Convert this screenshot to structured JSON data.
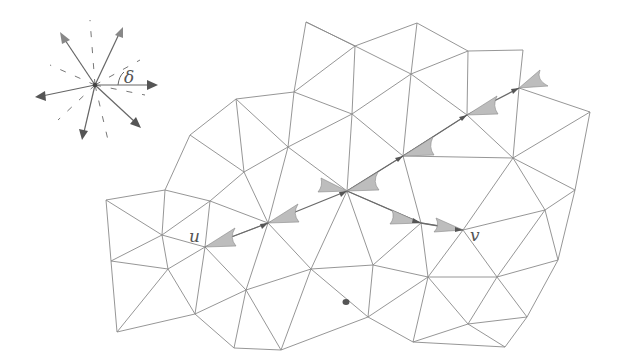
{
  "diagram": {
    "type": "triangle-mesh-path",
    "labels": {
      "u": "u",
      "v": "v",
      "delta": "δ"
    },
    "colors": {
      "mesh_edge": "#8a8a8a",
      "path_edge": "#6a6a6a",
      "cone_fill": "#bdbdbd",
      "arrowhead": "#555555"
    },
    "vertices": [
      [
        306,
        22
      ],
      [
        417,
        23
      ],
      [
        355,
        46
      ],
      [
        523,
        50
      ],
      [
        468,
        51
      ],
      [
        411,
        74
      ],
      [
        519,
        88
      ],
      [
        236,
        99
      ],
      [
        294,
        92
      ],
      [
        352,
        114
      ],
      [
        467,
        115
      ],
      [
        590,
        112
      ],
      [
        190,
        135
      ],
      [
        288,
        147
      ],
      [
        403,
        156
      ],
      [
        513,
        158
      ],
      [
        244,
        172
      ],
      [
        347,
        191
      ],
      [
        165,
        190
      ],
      [
        210,
        201
      ],
      [
        268,
        223
      ],
      [
        421,
        223
      ],
      [
        463,
        230
      ],
      [
        106,
        200
      ],
      [
        162,
        235
      ],
      [
        205,
        247
      ],
      [
        111,
        261
      ],
      [
        168,
        269
      ],
      [
        311,
        269
      ],
      [
        373,
        265
      ],
      [
        428,
        277
      ],
      [
        497,
        277
      ],
      [
        558,
        260
      ],
      [
        195,
        314
      ],
      [
        246,
        290
      ],
      [
        117,
        332
      ],
      [
        368,
        317
      ],
      [
        468,
        324
      ],
      [
        527,
        317
      ],
      [
        234,
        348
      ],
      [
        281,
        350
      ],
      [
        413,
        342
      ],
      [
        505,
        347
      ],
      [
        545,
        210
      ],
      [
        575,
        190
      ]
    ],
    "path_u_to_v_upper": [
      [
        205,
        247
      ],
      [
        268,
        223
      ],
      [
        347,
        191
      ],
      [
        403,
        156
      ],
      [
        467,
        115
      ],
      [
        519,
        88
      ]
    ],
    "path_center_to_v": [
      [
        347,
        191
      ],
      [
        421,
        223
      ],
      [
        463,
        230
      ]
    ],
    "marker_dot": [
      346,
      302
    ],
    "star_inset": {
      "center": [
        95,
        85
      ],
      "arrows": [
        [
          62,
          34
        ],
        [
          122,
          28
        ],
        [
          37,
          97
        ],
        [
          157,
          85
        ],
        [
          83,
          138
        ],
        [
          140,
          127
        ]
      ],
      "angle_label": "δ"
    }
  }
}
